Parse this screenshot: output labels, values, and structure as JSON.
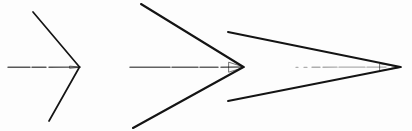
{
  "figure": {
    "title": "Three hand-drawn arrows of increasing size",
    "background_color": "#fdfdfd",
    "ink_color": "#141414",
    "shaft_color": "#3b3b3b",
    "faint_shaft_color": "#6d6d6d",
    "width": 412,
    "height": 131,
    "baseline_y": 67,
    "arrow_count": 3
  },
  "chart_data": {
    "type": "scatter",
    "title": "Three hand-drawn arrows of increasing size",
    "xlabel": "",
    "ylabel": "",
    "xlim": [
      0,
      412
    ],
    "ylim": [
      0,
      131
    ],
    "grid": false,
    "legend": "none",
    "categories": [
      "arrow-1-small",
      "arrow-2-medium",
      "arrow-3-large"
    ],
    "values": [
      73,
      118,
      172
    ],
    "annotations": [
      "Arrow sizes measured as barb span length in pixels",
      "All arrows share the same horizontal baseline at y = 67"
    ],
    "series": [
      {
        "name": "tip_x",
        "values": [
          79,
          243,
          400
        ]
      },
      {
        "name": "barb_length",
        "values": [
          73,
          118,
          172
        ]
      },
      {
        "name": "half_height",
        "values": [
          55,
          63,
          35
        ]
      }
    ]
  },
  "arrows": [
    {
      "id": "arrow-1-small",
      "label": "Small arrow",
      "tip_x": 79,
      "tip_y": 67,
      "top_barb_x": 33,
      "top_barb_y": 12,
      "bottom_barb_x": 49,
      "bottom_barb_y": 121,
      "shaft_start_x": 8,
      "shaft_end_x": 78,
      "stroke_width": 1.7,
      "shaft_width": 1.4,
      "shaft_dash": "22 2 14 3 30 2 9 1",
      "shaft_opacity": 0.85
    },
    {
      "id": "arrow-2-medium",
      "label": "Medium arrow",
      "tip_x": 243,
      "tip_y": 67,
      "top_barb_x": 141,
      "top_barb_y": 4,
      "bottom_barb_x": 133,
      "bottom_barb_y": 128,
      "shaft_start_x": 130,
      "shaft_end_x": 242,
      "stroke_width": 2.1,
      "shaft_width": 1.5,
      "shaft_dash": "40 2 26 2 18 3 22 1",
      "shaft_opacity": 0.8
    },
    {
      "id": "arrow-3-large",
      "label": "Large arrow",
      "tip_x": 400,
      "tip_y": 67,
      "top_barb_x": 228,
      "top_barb_y": 32,
      "bottom_barb_x": 228,
      "bottom_barb_y": 101,
      "shaft_start_x": 296,
      "shaft_end_x": 399,
      "stroke_width": 2.0,
      "shaft_width": 1.3,
      "shaft_dash": "2 6 3 5 8 3 14 2 26 2 16 1",
      "shaft_opacity": 0.55
    }
  ]
}
